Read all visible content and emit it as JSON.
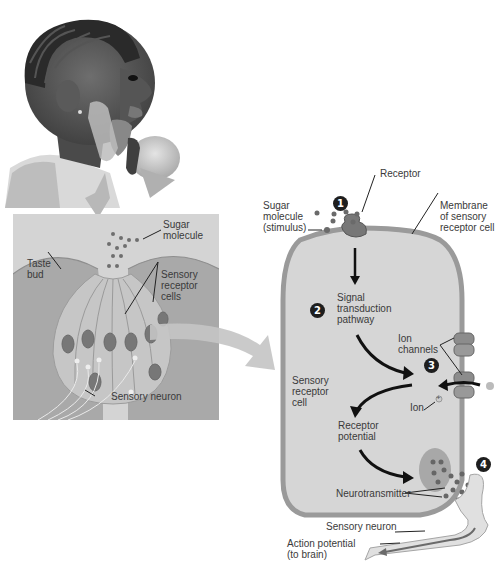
{
  "figure": {
    "photo_caption": "girl tasting ice cream",
    "taste_bud_panel": {
      "labels": {
        "sugar_molecule": [
          "Sugar",
          "molecule"
        ],
        "taste_bud": [
          "Taste",
          "bud"
        ],
        "sensory_receptor_cells": [
          "Sensory",
          "receptor",
          "cells"
        ],
        "sensory_neuron": "Sensory neuron"
      },
      "background_color": "#c8c8c8"
    },
    "cell_panel": {
      "steps": [
        "1",
        "2",
        "3",
        "4"
      ],
      "labels": {
        "receptor": "Receptor",
        "sugar_stimulus": [
          "Sugar",
          "molecule",
          "(stimulus)"
        ],
        "membrane": [
          "Membrane",
          "of sensory",
          "receptor cell"
        ],
        "signal_transduction": [
          "Signal",
          "transduction",
          "pathway"
        ],
        "ion_channels": [
          "Ion",
          "channels"
        ],
        "sensory_receptor_cell": [
          "Sensory",
          "receptor",
          "cell"
        ],
        "ion": "Ion",
        "receptor_potential": [
          "Receptor",
          "potential"
        ],
        "neurotransmitter": "Neurotransmitter",
        "sensory_neuron": "Sensory neuron",
        "action_potential": [
          "Action potential",
          "(to brain)"
        ]
      },
      "ion_symbol": "+",
      "colors": {
        "cell_fill": "#d6d6d6",
        "membrane": "#9a9a9a",
        "molecule": "#6a6a6a",
        "step_badge": "#1e1e1e"
      }
    }
  }
}
